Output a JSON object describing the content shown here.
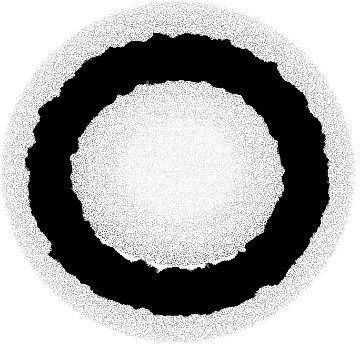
{
  "image": {
    "subject": "Black speckled ink ring on white background",
    "colors": {
      "background": "#ffffff",
      "ink": "#050505"
    }
  }
}
